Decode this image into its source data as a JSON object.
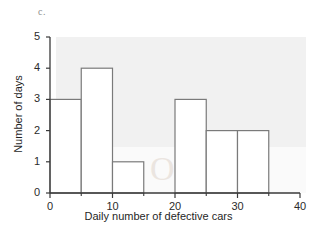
{
  "figure": {
    "panel_label": "c.",
    "watermark_text": "Oasfile"
  },
  "chart_data": {
    "type": "bar",
    "title": "",
    "xlabel": "Daily number of defective cars",
    "ylabel": "Number of days",
    "xlim": [
      0,
      40
    ],
    "ylim": [
      0,
      5
    ],
    "bin_width": 5,
    "grid": false,
    "legend": null,
    "bin_edges": [
      0,
      5,
      10,
      15,
      20,
      25,
      30,
      35,
      40
    ],
    "categories": [
      "0-5",
      "5-10",
      "10-15",
      "15-20",
      "20-25",
      "25-30",
      "30-35",
      "35-40"
    ],
    "values": [
      3,
      4,
      1,
      0,
      3,
      2,
      2,
      0
    ],
    "x_tick_labels": [
      "0",
      "10",
      "20",
      "30",
      "40"
    ],
    "x_tick_values": [
      0,
      10,
      20,
      30,
      40
    ],
    "x_minor_tick_values": [
      5,
      15,
      25,
      35
    ],
    "y_tick_labels": [
      "0",
      "1",
      "2",
      "3",
      "4",
      "5"
    ],
    "y_tick_values": [
      0,
      1,
      2,
      3,
      4,
      5
    ],
    "bar_fill_color": "#ffffff",
    "bar_edge_color": "#7a7a7a",
    "axis_color": "#3a3a3a",
    "background_color": "#ffffff",
    "shade_color": "#f1f1f1"
  }
}
